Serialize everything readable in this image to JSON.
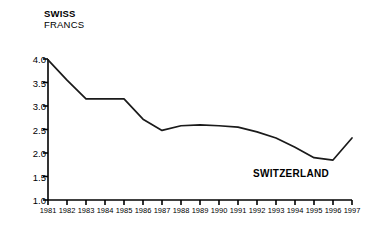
{
  "chart_data": {
    "type": "line",
    "title": "",
    "ylabel_lines": [
      "SWISS",
      "FRANCS"
    ],
    "ylabel": "SWISS FRANCS",
    "xlabel": "",
    "series_label": "SWITZERLAND",
    "legend_position": "inline-right",
    "grid": false,
    "ylim": [
      1.0,
      4.0
    ],
    "ytick_labels": [
      "4.0",
      "3.5",
      "3.0",
      "2.5",
      "2.0",
      "1.5",
      "1.0"
    ],
    "yticks": [
      4.0,
      3.5,
      3.0,
      2.5,
      2.0,
      1.5,
      1.0
    ],
    "categories": [
      "1981",
      "1982",
      "1983",
      "1984",
      "1985",
      "1986",
      "1987",
      "1988",
      "1989",
      "1990",
      "1991",
      "1992",
      "1993",
      "1994",
      "1995",
      "1996",
      "1997"
    ],
    "x": [
      1981,
      1982,
      1983,
      1984,
      1985,
      1986,
      1987,
      1988,
      1989,
      1990,
      1991,
      1992,
      1993,
      1994,
      1995,
      1996,
      1997
    ],
    "series": [
      {
        "name": "SWITZERLAND",
        "values": [
          3.98,
          3.55,
          3.15,
          3.15,
          3.15,
          2.72,
          2.48,
          2.58,
          2.6,
          2.58,
          2.55,
          2.45,
          2.32,
          2.12,
          1.9,
          1.85,
          2.32
        ]
      }
    ]
  },
  "axis": {
    "y_title_line1": "SWISS",
    "y_title_line2": "FRANCS"
  }
}
